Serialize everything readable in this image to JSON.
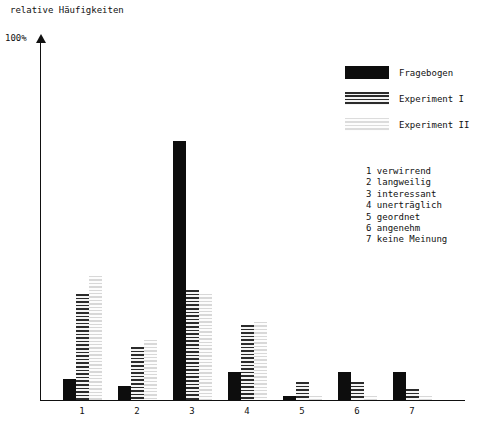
{
  "chart_data": {
    "type": "bar",
    "title": "relative Häufigkeiten",
    "ylabel": "relative Häufigkeiten",
    "xlabel": "",
    "ymax_label": "100%",
    "ylim": [
      0,
      100
    ],
    "grid": false,
    "legend_position": "top-right",
    "categories": [
      "1",
      "2",
      "3",
      "4",
      "5",
      "6",
      "7"
    ],
    "category_key": [
      {
        "num": "1",
        "text": "1 verwirrend"
      },
      {
        "num": "2",
        "text": "2 langweilig"
      },
      {
        "num": "3",
        "text": "3 interessant"
      },
      {
        "num": "4",
        "text": "4 unerträglich"
      },
      {
        "num": "5",
        "text": "5 geordnet"
      },
      {
        "num": "6",
        "text": "6 angenehm"
      },
      {
        "num": "7",
        "text": "7 keine Meinung"
      }
    ],
    "series": [
      {
        "name": "Fragebogen",
        "fill": "solid",
        "values": [
          6,
          4,
          73,
          8,
          1,
          8,
          8
        ]
      },
      {
        "name": "Experiment I",
        "fill": "stripeA",
        "values": [
          30,
          15,
          31,
          21,
          5,
          5,
          3
        ]
      },
      {
        "name": "Experiment II",
        "fill": "stripeB",
        "values": [
          35,
          17,
          30,
          22,
          1,
          1,
          1
        ]
      }
    ]
  },
  "legend": {
    "items": [
      {
        "label": "Fragebogen",
        "fill": "solid"
      },
      {
        "label": "Experiment I",
        "fill": "stripeA"
      },
      {
        "label": "Experiment II",
        "fill": "stripeB"
      }
    ]
  },
  "colors": {
    "ink": "#0d0d0d",
    "stripe_dark": "#2b2b2b",
    "stripe_light": "#d8d8d8",
    "background": "#ffffff"
  },
  "layout": {
    "group_start_x": 23,
    "group_pitch": 55,
    "bar_width": 13,
    "plot_height_px": 355
  }
}
